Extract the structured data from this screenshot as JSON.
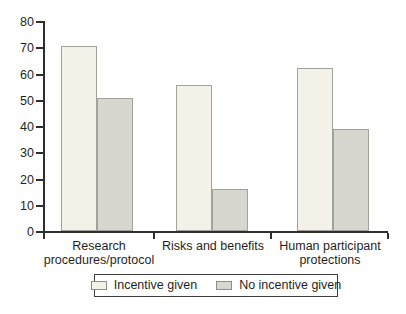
{
  "chart_data": {
    "type": "bar",
    "title": "",
    "xlabel": "",
    "ylabel": "",
    "categories": [
      "Research procedures/protocol",
      "Risks and benefits",
      "Human participant protections"
    ],
    "category_lines": [
      [
        "Research",
        "procedures/protocol"
      ],
      [
        "Risks and benefits"
      ],
      [
        "Human participant",
        "protections"
      ]
    ],
    "series": [
      {
        "name": "Incentive given",
        "color": "#f3f1e8",
        "values": [
          70.5,
          55.5,
          62
        ]
      },
      {
        "name": "No incentive given",
        "color": "#d7d6cf",
        "values": [
          50.5,
          16,
          39
        ]
      }
    ],
    "ylim": [
      0,
      80
    ],
    "yticks": [
      0,
      10,
      20,
      30,
      40,
      50,
      60,
      70,
      80
    ],
    "grid": false,
    "legend_position": "bottom",
    "colors": {
      "axis": "#2e2e2e",
      "bar_border": "#a3a19b",
      "legend_border": "#3d3d3d",
      "text": "#1f1f1f",
      "background": "#ffffff"
    }
  }
}
